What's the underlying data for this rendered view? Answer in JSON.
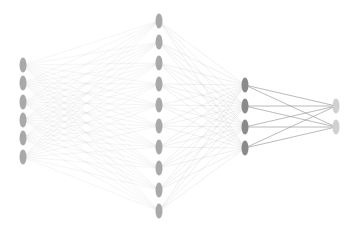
{
  "diagram": {
    "type": "neural-network",
    "background": "#ffffff",
    "layers": [
      {
        "name": "input",
        "x": 23,
        "y": [
          65,
          83,
          102,
          120,
          138,
          157
        ],
        "color": "#a9a9a9"
      },
      {
        "name": "hidden-1",
        "x": 159,
        "y": [
          21,
          42,
          63,
          84,
          105,
          126,
          147,
          168,
          190,
          211
        ],
        "color": "#a9a9a9"
      },
      {
        "name": "hidden-2",
        "x": 245,
        "y": [
          85,
          106,
          127,
          148
        ],
        "color": "#8a8a8a"
      },
      {
        "name": "output",
        "x": 336,
        "y": [
          106,
          127
        ],
        "color": "#d0d0d0"
      }
    ],
    "node": {
      "rx": 3.5,
      "ry": 7.5
    },
    "edges": [
      {
        "from": 0,
        "to": 1,
        "color": "#cfcfcf",
        "opacity": 0.35,
        "width": 0.6
      },
      {
        "from": 1,
        "to": 2,
        "color": "#c8c8c8",
        "opacity": 0.45,
        "width": 0.6
      },
      {
        "from": 2,
        "to": 3,
        "color": "#a0a0a0",
        "opacity": 0.8,
        "width": 0.9
      }
    ]
  }
}
